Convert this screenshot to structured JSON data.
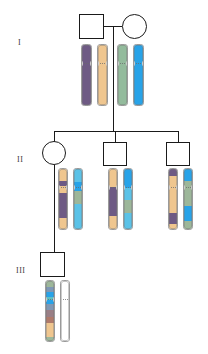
{
  "figure": {
    "background": "#ffffff",
    "width": 208,
    "height": 354
  },
  "generations": [
    {
      "id": "I",
      "label": "I",
      "label_x": 18,
      "label_y": 38
    },
    {
      "id": "II",
      "label": "II",
      "label_y": 155,
      "label_x": 17
    },
    {
      "id": "III",
      "label": "III",
      "label_y": 266,
      "label_x": 16
    }
  ],
  "symbols": [
    {
      "name": "individual-I-1",
      "sex": "male",
      "shape": "square",
      "x": 79,
      "y": 14,
      "w": 25,
      "h": 25
    },
    {
      "name": "individual-I-2",
      "sex": "female",
      "shape": "circle",
      "x": 122,
      "y": 14,
      "w": 25,
      "h": 25
    },
    {
      "name": "individual-II-1",
      "sex": "female",
      "shape": "circle",
      "x": 42,
      "y": 141,
      "w": 24,
      "h": 24
    },
    {
      "name": "individual-II-2",
      "sex": "male",
      "shape": "square",
      "x": 103,
      "y": 142,
      "w": 24,
      "h": 24
    },
    {
      "name": "individual-II-3",
      "sex": "male",
      "shape": "square",
      "x": 166,
      "y": 142,
      "w": 24,
      "h": 24
    },
    {
      "name": "individual-III-1",
      "sex": "male",
      "shape": "square",
      "x": 40,
      "y": 252,
      "w": 25,
      "h": 25
    }
  ],
  "connectors": [
    {
      "name": "mating-line-I",
      "type": "h",
      "x": 104,
      "y": 26,
      "len": 18
    },
    {
      "name": "descent-line-I",
      "type": "v",
      "x": 113,
      "y": 26,
      "len": 105
    },
    {
      "name": "sibship-line-II",
      "type": "h",
      "x": 54,
      "y": 131,
      "len": 124
    },
    {
      "name": "drop-line-II-1",
      "type": "v",
      "x": 54,
      "y": 131,
      "len": 11
    },
    {
      "name": "drop-line-II-2",
      "type": "v",
      "x": 115,
      "y": 131,
      "len": 11
    },
    {
      "name": "drop-line-II-3",
      "type": "v",
      "x": 178,
      "y": 131,
      "len": 11
    },
    {
      "name": "descent-line-II-1",
      "type": "v",
      "x": 54,
      "y": 165,
      "len": 87
    },
    {
      "name": "drop-line-III-1",
      "type": "v",
      "x": 54,
      "y": 240,
      "len": 12
    }
  ],
  "palette": {
    "purple": "#6e5a84",
    "tan": "#efc68f",
    "green": "#93bb9c",
    "blue": "#28a3e8",
    "sage": "#9db79a",
    "lightblue": "#5bc2e7",
    "teal": "#5bbfc4",
    "steel": "#7f98b5",
    "mauve": "#9a7f86",
    "rust": "#b07a6a",
    "white": "#ffffff",
    "outline": "#9a9a9a",
    "ink": "#1a1a1a"
  },
  "chromosome_sets": [
    {
      "name": "chromosomes-I-1",
      "owner": "individual-I-1",
      "x": 81,
      "y": 44,
      "w": 11,
      "h": 62,
      "gap": 5,
      "centromere_frac": 0.3,
      "chromosomes": [
        {
          "name": "chromosome-I-1-a",
          "bands": [
            {
              "color": "#6e5a84",
              "from": 0.0,
              "to": 1.0
            }
          ]
        },
        {
          "name": "chromosome-I-1-b",
          "bands": [
            {
              "color": "#efc68f",
              "from": 0.0,
              "to": 1.0
            }
          ]
        }
      ]
    },
    {
      "name": "chromosomes-I-2",
      "owner": "individual-I-2",
      "x": 117,
      "y": 44,
      "w": 11,
      "h": 62,
      "gap": 5,
      "centromere_frac": 0.3,
      "chromosomes": [
        {
          "name": "chromosome-I-2-a",
          "bands": [
            {
              "color": "#93bb9c",
              "from": 0.0,
              "to": 1.0
            }
          ]
        },
        {
          "name": "chromosome-I-2-b",
          "bands": [
            {
              "color": "#28a3e8",
              "from": 0.0,
              "to": 1.0
            }
          ]
        }
      ]
    },
    {
      "name": "chromosomes-II-1",
      "owner": "individual-II-1",
      "x": 58,
      "y": 168,
      "w": 10,
      "h": 62,
      "gap": 5,
      "centromere_frac": 0.3,
      "chromosomes": [
        {
          "name": "chromosome-II-1-a",
          "bands": [
            {
              "color": "#efc68f",
              "from": 0.0,
              "to": 0.2
            },
            {
              "color": "#6e5a84",
              "from": 0.2,
              "to": 0.28
            },
            {
              "color": "#efc68f",
              "from": 0.28,
              "to": 0.4
            },
            {
              "color": "#6e5a84",
              "from": 0.4,
              "to": 0.82
            },
            {
              "color": "#efc68f",
              "from": 0.82,
              "to": 1.0
            }
          ]
        },
        {
          "name": "chromosome-II-1-b",
          "bands": [
            {
              "color": "#5bc2e7",
              "from": 0.0,
              "to": 0.22
            },
            {
              "color": "#28a3e8",
              "from": 0.22,
              "to": 0.36
            },
            {
              "color": "#9db79a",
              "from": 0.36,
              "to": 0.58
            },
            {
              "color": "#5bc2e7",
              "from": 0.58,
              "to": 1.0
            }
          ]
        }
      ]
    },
    {
      "name": "chromosomes-II-2",
      "owner": "individual-II-2",
      "x": 108,
      "y": 168,
      "w": 10,
      "h": 62,
      "gap": 5,
      "centromere_frac": 0.3,
      "chromosomes": [
        {
          "name": "chromosome-II-2-a",
          "bands": [
            {
              "color": "#efc68f",
              "from": 0.0,
              "to": 0.3
            },
            {
              "color": "#6e5a84",
              "from": 0.3,
              "to": 0.78
            },
            {
              "color": "#efc68f",
              "from": 0.78,
              "to": 1.0
            }
          ]
        },
        {
          "name": "chromosome-II-2-b",
          "bands": [
            {
              "color": "#28a3e8",
              "from": 0.0,
              "to": 0.32
            },
            {
              "color": "#5bc2e7",
              "from": 0.32,
              "to": 0.52
            },
            {
              "color": "#9db79a",
              "from": 0.52,
              "to": 0.74
            },
            {
              "color": "#5bc2e7",
              "from": 0.74,
              "to": 1.0
            }
          ]
        }
      ]
    },
    {
      "name": "chromosomes-II-3",
      "owner": "individual-II-3",
      "x": 168,
      "y": 168,
      "w": 10,
      "h": 62,
      "gap": 5,
      "centromere_frac": 0.3,
      "chromosomes": [
        {
          "name": "chromosome-II-3-a",
          "bands": [
            {
              "color": "#6e5a84",
              "from": 0.0,
              "to": 0.12
            },
            {
              "color": "#efc68f",
              "from": 0.12,
              "to": 0.74
            },
            {
              "color": "#6e5a84",
              "from": 0.74,
              "to": 0.92
            },
            {
              "color": "#efc68f",
              "from": 0.92,
              "to": 1.0
            }
          ]
        },
        {
          "name": "chromosome-II-3-b",
          "bands": [
            {
              "color": "#28a3e8",
              "from": 0.0,
              "to": 0.2
            },
            {
              "color": "#9db79a",
              "from": 0.2,
              "to": 0.62
            },
            {
              "color": "#28a3e8",
              "from": 0.62,
              "to": 0.86
            },
            {
              "color": "#9db79a",
              "from": 0.86,
              "to": 1.0
            }
          ]
        }
      ]
    },
    {
      "name": "chromosomes-III-1",
      "owner": "individual-III-1",
      "x": 45,
      "y": 280,
      "w": 10,
      "h": 62,
      "gap": 5,
      "centromere_frac": 0.3,
      "chromosomes": [
        {
          "name": "chromosome-III-1-a",
          "bands": [
            {
              "color": "#9db79a",
              "from": 0.0,
              "to": 0.1
            },
            {
              "color": "#7f98b5",
              "from": 0.1,
              "to": 0.18
            },
            {
              "color": "#28a3e8",
              "from": 0.18,
              "to": 0.26
            },
            {
              "color": "#5bbfc4",
              "from": 0.26,
              "to": 0.32
            },
            {
              "color": "#28a3e8",
              "from": 0.32,
              "to": 0.38
            },
            {
              "color": "#7f98b5",
              "from": 0.38,
              "to": 0.48
            },
            {
              "color": "#9a7f86",
              "from": 0.48,
              "to": 0.6
            },
            {
              "color": "#b07a6a",
              "from": 0.6,
              "to": 0.7
            },
            {
              "color": "#efc68f",
              "from": 0.7,
              "to": 0.94
            },
            {
              "color": "#9db79a",
              "from": 0.94,
              "to": 1.0
            }
          ]
        },
        {
          "name": "chromosome-III-1-b",
          "bands": [
            {
              "color": "#ffffff",
              "from": 0.0,
              "to": 1.0
            }
          ]
        }
      ]
    }
  ]
}
